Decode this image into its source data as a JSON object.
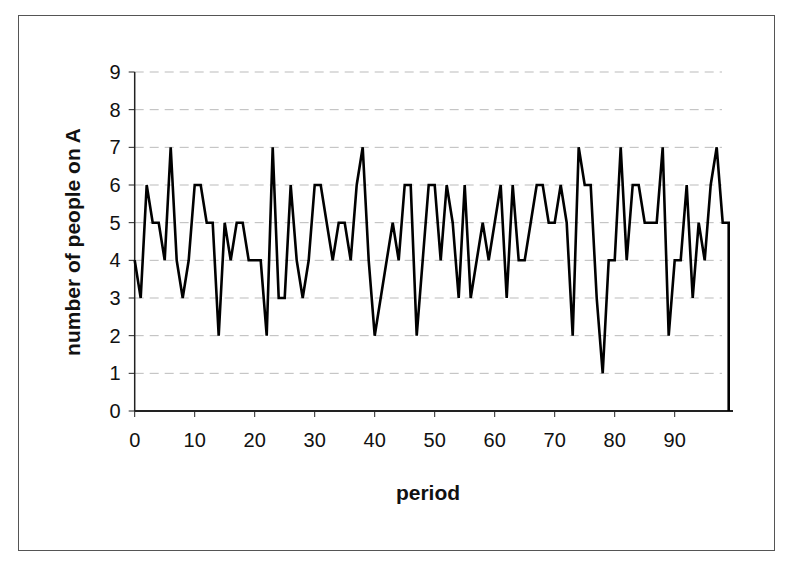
{
  "chart_data": {
    "type": "line",
    "title": "",
    "xlabel": "period",
    "ylabel": "number of people on A",
    "xlim": [
      0,
      99
    ],
    "ylim": [
      0,
      9
    ],
    "x_ticks": [
      0,
      10,
      20,
      30,
      40,
      50,
      60,
      70,
      80,
      90
    ],
    "y_ticks": [
      0,
      1,
      2,
      3,
      4,
      5,
      6,
      7,
      8,
      9
    ],
    "grid": {
      "horizontal": true,
      "style": "dashed",
      "color": "#bbbbbb"
    },
    "legend": null,
    "series": [
      {
        "name": "number of people on A",
        "color": "#000000",
        "x": [
          0,
          1,
          2,
          3,
          4,
          5,
          6,
          7,
          8,
          9,
          10,
          11,
          12,
          13,
          14,
          15,
          16,
          17,
          18,
          19,
          20,
          21,
          22,
          23,
          24,
          25,
          26,
          27,
          28,
          29,
          30,
          31,
          32,
          33,
          34,
          35,
          36,
          37,
          38,
          39,
          40,
          41,
          42,
          43,
          44,
          45,
          46,
          47,
          48,
          49,
          50,
          51,
          52,
          53,
          54,
          55,
          56,
          57,
          58,
          59,
          60,
          61,
          62,
          63,
          64,
          65,
          66,
          67,
          68,
          69,
          70,
          71,
          72,
          73,
          74,
          75,
          76,
          77,
          78,
          79,
          80,
          81,
          82,
          83,
          84,
          85,
          86,
          87,
          88,
          89,
          90,
          91,
          92,
          93,
          94,
          95,
          96,
          97,
          98,
          99
        ],
        "values": [
          4,
          3,
          6,
          5,
          5,
          4,
          7,
          4,
          3,
          4,
          6,
          6,
          5,
          5,
          2,
          5,
          4,
          5,
          5,
          4,
          4,
          4,
          2,
          7,
          3,
          3,
          6,
          4,
          3,
          4,
          6,
          6,
          5,
          4,
          5,
          5,
          4,
          6,
          7,
          4,
          2,
          3,
          4,
          5,
          4,
          6,
          6,
          2,
          4,
          6,
          6,
          4,
          6,
          5,
          3,
          6,
          3,
          4,
          5,
          4,
          5,
          6,
          3,
          6,
          4,
          4,
          5,
          6,
          6,
          5,
          5,
          6,
          5,
          2,
          7,
          6,
          6,
          3,
          1,
          4,
          4,
          7,
          4,
          6,
          6,
          5,
          5,
          5,
          7,
          2,
          4,
          4,
          6,
          3,
          5,
          4,
          6,
          7,
          5,
          5
        ]
      }
    ]
  }
}
